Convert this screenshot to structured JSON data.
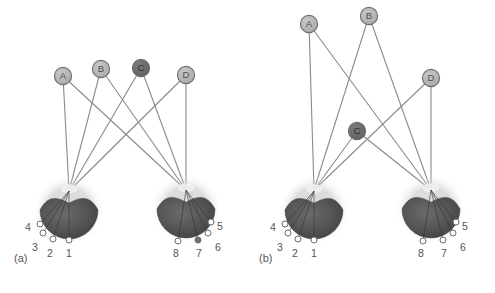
{
  "figure": {
    "background": "#ffffff",
    "width": 495,
    "height": 293,
    "edge_color": "#8a8a8a",
    "node_fill_light": "#b5b5b5",
    "node_fill_dark": "#6e6e6e",
    "node_stroke": "#6f6f6f",
    "node_text_color": "#4a4a4a",
    "marker_fill": "#ffffff",
    "marker_fill_dark": "#707070",
    "marker_stroke": "#6b6b6b",
    "label_color": "#545454",
    "globe_dark": "#4e4e4e",
    "globe_mid": "#5c5c5c",
    "globe_halo": "#d8d8d8"
  },
  "panels": [
    {
      "id": "a",
      "caption": "(a)",
      "caption_x": 14,
      "caption_y": 262,
      "nodes": [
        {
          "label": "A",
          "x": 63,
          "y": 76,
          "shade": "light"
        },
        {
          "label": "B",
          "x": 101,
          "y": 69,
          "shade": "light"
        },
        {
          "label": "C",
          "x": 141,
          "y": 68,
          "shade": "dark"
        },
        {
          "label": "D",
          "x": 186,
          "y": 75,
          "shade": "light"
        }
      ],
      "hubs": [
        {
          "side": "left",
          "x": 69,
          "y": 191
        },
        {
          "side": "right",
          "x": 186,
          "y": 190
        }
      ],
      "edges": [
        {
          "from": "A",
          "to": "left"
        },
        {
          "from": "A",
          "to": "right"
        },
        {
          "from": "B",
          "to": "left"
        },
        {
          "from": "B",
          "to": "right"
        },
        {
          "from": "C",
          "to": "left"
        },
        {
          "from": "C",
          "to": "right"
        },
        {
          "from": "D",
          "to": "left"
        },
        {
          "from": "D",
          "to": "right"
        }
      ],
      "globes": [
        {
          "side": "left",
          "cx": 69,
          "cy": 212,
          "r": 29
        },
        {
          "side": "right",
          "cx": 186,
          "cy": 211,
          "r": 29
        }
      ],
      "markers": [
        {
          "label": "1",
          "mx": 69,
          "my": 240,
          "tx": 69,
          "ty": 254,
          "fill": "white"
        },
        {
          "label": "2",
          "mx": 53,
          "my": 239,
          "tx": 50,
          "ty": 254,
          "fill": "white"
        },
        {
          "label": "3",
          "mx": 43,
          "my": 233,
          "tx": 35,
          "ty": 248,
          "fill": "white"
        },
        {
          "label": "4",
          "mx": 40,
          "my": 224,
          "tx": 28,
          "ty": 228,
          "fill": "white"
        },
        {
          "label": "5",
          "mx": 211,
          "my": 222,
          "tx": 220,
          "ty": 227,
          "fill": "white"
        },
        {
          "label": "6",
          "mx": 208,
          "my": 233,
          "tx": 218,
          "ty": 248,
          "fill": "white"
        },
        {
          "label": "7",
          "mx": 198,
          "my": 240,
          "tx": 199,
          "ty": 254,
          "fill": "dark"
        },
        {
          "label": "8",
          "mx": 178,
          "my": 241,
          "tx": 176,
          "ty": 254,
          "fill": "white"
        }
      ]
    },
    {
      "id": "b",
      "caption": "(b)",
      "caption_x": 259,
      "caption_y": 262,
      "nodes": [
        {
          "label": "A",
          "x": 309,
          "y": 24,
          "shade": "light"
        },
        {
          "label": "B",
          "x": 369,
          "y": 16,
          "shade": "light"
        },
        {
          "label": "C",
          "x": 357,
          "y": 131,
          "shade": "dark"
        },
        {
          "label": "D",
          "x": 431,
          "y": 78,
          "shade": "light"
        }
      ],
      "hubs": [
        {
          "side": "left",
          "x": 314,
          "y": 190
        },
        {
          "side": "right",
          "x": 431,
          "y": 190
        }
      ],
      "edges": [
        {
          "from": "A",
          "to": "left"
        },
        {
          "from": "A",
          "to": "right"
        },
        {
          "from": "B",
          "to": "left"
        },
        {
          "from": "B",
          "to": "right"
        },
        {
          "from": "C",
          "to": "left"
        },
        {
          "from": "C",
          "to": "right"
        },
        {
          "from": "D",
          "to": "left"
        },
        {
          "from": "D",
          "to": "right"
        }
      ],
      "globes": [
        {
          "side": "left",
          "cx": 314,
          "cy": 212,
          "r": 29
        },
        {
          "side": "right",
          "cx": 431,
          "cy": 211,
          "r": 29
        }
      ],
      "markers": [
        {
          "label": "1",
          "mx": 314,
          "my": 240,
          "tx": 314,
          "ty": 254,
          "fill": "white"
        },
        {
          "label": "2",
          "mx": 298,
          "my": 239,
          "tx": 295,
          "ty": 254,
          "fill": "white"
        },
        {
          "label": "3",
          "mx": 288,
          "my": 233,
          "tx": 280,
          "ty": 248,
          "fill": "white"
        },
        {
          "label": "4",
          "mx": 285,
          "my": 224,
          "tx": 273,
          "ty": 228,
          "fill": "white"
        },
        {
          "label": "5",
          "mx": 456,
          "my": 222,
          "tx": 465,
          "ty": 227,
          "fill": "white"
        },
        {
          "label": "6",
          "mx": 453,
          "my": 233,
          "tx": 463,
          "ty": 248,
          "fill": "white"
        },
        {
          "label": "7",
          "mx": 443,
          "my": 240,
          "tx": 444,
          "ty": 254,
          "fill": "white"
        },
        {
          "label": "8",
          "mx": 423,
          "my": 241,
          "tx": 421,
          "ty": 254,
          "fill": "white"
        }
      ]
    }
  ]
}
